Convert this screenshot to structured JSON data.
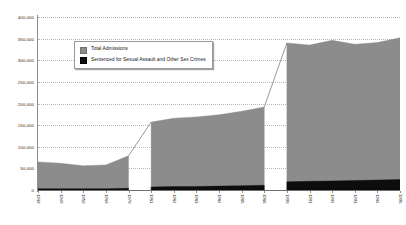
{
  "chart_data": {
    "type": "area",
    "stacked": true,
    "title": "",
    "subtitle": "",
    "xlabel": "",
    "ylabel": "",
    "ylim": [
      0,
      400000
    ],
    "ytick_labels": [
      "0",
      "50,000",
      "100,000",
      "150,000",
      "200,000",
      "250,000",
      "300,000",
      "350,000",
      "400,000"
    ],
    "ytick_values": [
      0,
      50000,
      100000,
      150000,
      200000,
      250000,
      300000,
      350000,
      400000
    ],
    "ytick_step": 50000,
    "grid": true,
    "grid_style": "dotted horizontal",
    "legend_position": "upper-left-inside",
    "categories": [
      "1939",
      "1940",
      "1950",
      "1960",
      "1970",
      "1981",
      "1982",
      "1983",
      "1984",
      "1985",
      "1986",
      "1990",
      "1991",
      "1992",
      "1993",
      "1994",
      "1995"
    ],
    "segments": [
      {
        "name": "decadal",
        "categories": [
          "1939",
          "1940",
          "1950",
          "1960",
          "1970"
        ]
      },
      {
        "name": "early-eighties",
        "categories": [
          "1981",
          "1982",
          "1983",
          "1984",
          "1985",
          "1986"
        ]
      },
      {
        "name": "nineties",
        "categories": [
          "1990",
          "1991",
          "1992",
          "1993",
          "1994",
          "1995"
        ]
      }
    ],
    "series": [
      {
        "name": "Total Admissions",
        "color": "#8c8c8c",
        "values": [
          65000,
          62000,
          56000,
          58000,
          79000,
          157000,
          166000,
          169000,
          174000,
          182000,
          192000,
          340000,
          335000,
          346000,
          337000,
          341000,
          352000
        ]
      },
      {
        "name": "Sentenced for Sexual Assault and Other Sex Crimes",
        "color": "#0d0d0d",
        "values": [
          3000,
          3000,
          3000,
          3000,
          4000,
          7000,
          8000,
          8000,
          9000,
          10000,
          11000,
          19000,
          20000,
          21000,
          22000,
          23000,
          24000
        ]
      }
    ],
    "legend": [
      {
        "label": "Total Admissions",
        "swatch": "gray",
        "color": "#8c8c8c"
      },
      {
        "label": "Sentenced for Sexual Assault and Other Sex Crimes",
        "swatch": "black",
        "color": "#0d0d0d"
      }
    ]
  }
}
